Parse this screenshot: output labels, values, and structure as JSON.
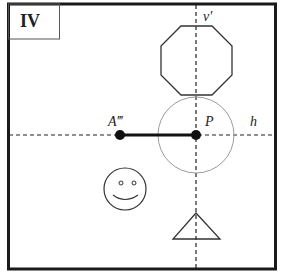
{
  "panel": {
    "label": "IV"
  },
  "axes": {
    "vertical_label": "v′",
    "horizontal_label": "h"
  },
  "points": {
    "a": {
      "label": "A‴",
      "x": 120,
      "y": 135
    },
    "p": {
      "label": "P",
      "x": 196,
      "y": 135
    }
  },
  "shapes": {
    "octagon": "octagon",
    "circle": "circle",
    "smiley": "smiley-face",
    "triangle": "triangle"
  },
  "colors": {
    "ink": "#1a1a1a",
    "circle_stroke": "#9a9a9a",
    "shape_stroke": "#333333"
  }
}
